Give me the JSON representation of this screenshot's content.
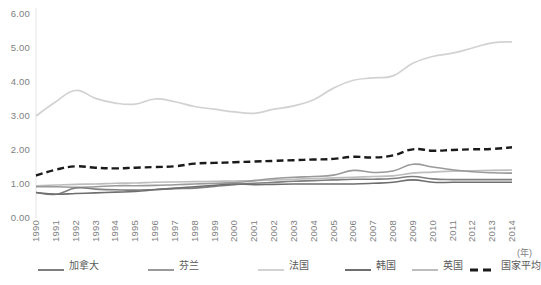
{
  "chart_data": {
    "type": "line",
    "title": "",
    "subtitle": "",
    "xlabel": "(年)",
    "ylabel": "",
    "xlim": [
      1990,
      2014
    ],
    "ylim": [
      0,
      6
    ],
    "grid": false,
    "legend_position": "bottom",
    "x": [
      1990,
      1991,
      1992,
      1993,
      1994,
      1995,
      1996,
      1997,
      1998,
      1999,
      2000,
      2001,
      2002,
      2003,
      2004,
      2005,
      2006,
      2007,
      2008,
      2009,
      2010,
      2011,
      2012,
      2013,
      2014
    ],
    "y_ticks": [
      "0.00",
      "1.00",
      "2.00",
      "3.00",
      "4.00",
      "5.00",
      "6.00"
    ],
    "y_tick_values": [
      0,
      1,
      2,
      3,
      4,
      5,
      6
    ],
    "x_tick_labels": [
      "1990",
      "1991",
      "1992",
      "1993",
      "1994",
      "1995",
      "1996",
      "1997",
      "1998",
      "1999",
      "2000",
      "2001",
      "2002",
      "2003",
      "2004",
      "2005",
      "2006",
      "2007",
      "2008",
      "2009",
      "2010",
      "2011",
      "2012",
      "2013",
      "2014"
    ],
    "series": [
      {
        "name": "加拿大",
        "color": "#7f7f7f",
        "style": "solid",
        "width": 1.6,
        "values": [
          0.75,
          0.7,
          0.88,
          0.85,
          0.83,
          0.82,
          0.84,
          0.86,
          0.88,
          0.93,
          0.98,
          1.02,
          1.05,
          1.08,
          1.1,
          1.12,
          1.14,
          1.14,
          1.16,
          1.22,
          1.15,
          1.13,
          1.13,
          1.13,
          1.13
        ]
      },
      {
        "name": "芬兰",
        "color": "#9a9a9a",
        "style": "solid",
        "width": 1.6,
        "values": [
          0.92,
          0.92,
          0.9,
          0.92,
          0.95,
          0.95,
          0.96,
          0.98,
          1.0,
          1.02,
          1.04,
          1.1,
          1.16,
          1.2,
          1.22,
          1.26,
          1.4,
          1.34,
          1.38,
          1.58,
          1.5,
          1.42,
          1.36,
          1.33,
          1.32
        ]
      },
      {
        "name": "法国",
        "color": "#d2d2d2",
        "style": "solid",
        "width": 1.7,
        "values": [
          3.0,
          3.42,
          3.75,
          3.52,
          3.38,
          3.35,
          3.5,
          3.42,
          3.28,
          3.2,
          3.12,
          3.08,
          3.2,
          3.3,
          3.48,
          3.82,
          4.05,
          4.12,
          4.18,
          4.55,
          4.75,
          4.85,
          5.0,
          5.15,
          5.18
        ]
      },
      {
        "name": "韩国",
        "color": "#6e6e6e",
        "style": "solid",
        "width": 1.6,
        "values": [
          0.75,
          0.7,
          0.72,
          0.74,
          0.76,
          0.78,
          0.83,
          0.88,
          0.92,
          0.96,
          1.0,
          0.98,
          0.99,
          1.0,
          1.0,
          1.0,
          1.0,
          1.02,
          1.05,
          1.12,
          1.05,
          1.05,
          1.05,
          1.05,
          1.05
        ]
      },
      {
        "name": "英国",
        "color": "#bdbdbd",
        "style": "solid",
        "width": 1.6,
        "values": [
          0.95,
          0.97,
          0.99,
          1.0,
          1.02,
          1.03,
          1.05,
          1.06,
          1.07,
          1.08,
          1.09,
          1.1,
          1.12,
          1.14,
          1.16,
          1.18,
          1.2,
          1.22,
          1.24,
          1.32,
          1.35,
          1.38,
          1.39,
          1.4,
          1.41
        ]
      },
      {
        "name": "国家平均",
        "color": "#1a1a1a",
        "style": "dashed",
        "width": 2.4,
        "values": [
          1.25,
          1.42,
          1.52,
          1.48,
          1.46,
          1.48,
          1.5,
          1.52,
          1.6,
          1.62,
          1.64,
          1.66,
          1.68,
          1.7,
          1.72,
          1.74,
          1.8,
          1.78,
          1.84,
          2.02,
          1.98,
          2.0,
          2.02,
          2.03,
          2.08
        ]
      }
    ]
  },
  "legend": {
    "items": [
      {
        "label": "加拿大",
        "color": "#7f7f7f",
        "style": "solid"
      },
      {
        "label": "芬兰",
        "color": "#9a9a9a",
        "style": "solid"
      },
      {
        "label": "法国",
        "color": "#d2d2d2",
        "style": "solid"
      },
      {
        "label": "韩国",
        "color": "#6e6e6e",
        "style": "solid"
      },
      {
        "label": "英国",
        "color": "#bdbdbd",
        "style": "solid"
      },
      {
        "label": "国家平均",
        "color": "#1a1a1a",
        "style": "dashed"
      }
    ]
  },
  "axis": {
    "x_unit": "(年)",
    "axis_line_color": "#e4e4e4"
  }
}
